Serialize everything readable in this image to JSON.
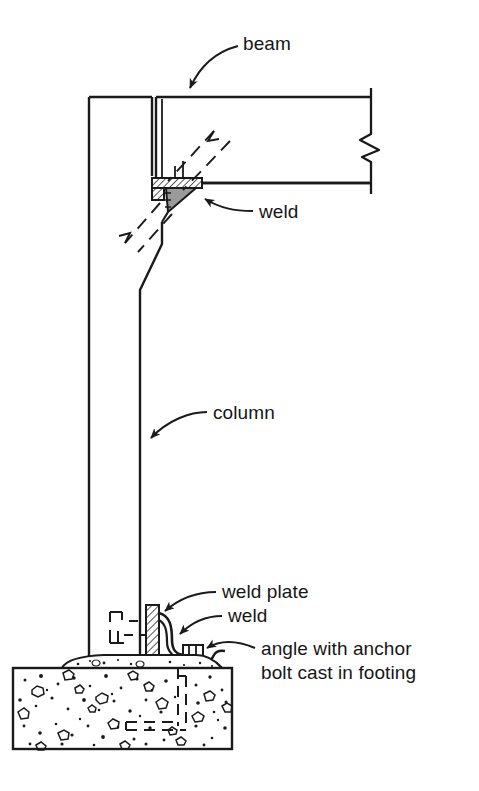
{
  "figure": {
    "name": "structural-connection-detail",
    "background_color": "#ffffff",
    "line_color": "#1a1a1a",
    "weld_fill_color": "#9a9a9a",
    "plate_hatch_color": "#1a1a1a"
  },
  "labels": {
    "beam": "beam",
    "weld_top": "weld",
    "column": "column",
    "weld_plate": "weld plate",
    "weld_bottom": "weld",
    "angle_line1": "angle with anchor",
    "angle_line2": "bolt cast in footing"
  },
  "parts": [
    {
      "id": "column",
      "label": "column",
      "description": "vertical steel column, tapered at upper transition"
    },
    {
      "id": "beam",
      "label": "beam",
      "description": "horizontal steel beam with break symbol at right"
    },
    {
      "id": "weld-top",
      "label": "weld",
      "description": "fillet weld at beam seat to column"
    },
    {
      "id": "seat-plate",
      "label": "seat plate",
      "description": "hatched bearing plate under beam"
    },
    {
      "id": "weld-plate",
      "label": "weld plate",
      "description": "hatched vertical plate at column base"
    },
    {
      "id": "weld-bottom",
      "label": "weld",
      "description": "fillet weld joining base plate to angle"
    },
    {
      "id": "angle-anchor",
      "label": "angle with anchor bolt cast in footing",
      "description": "steel angle with anchor bolt embedded in concrete footing"
    },
    {
      "id": "footing",
      "label": "footing",
      "description": "concrete footing shown with aggregate hatch"
    },
    {
      "id": "grout-bed",
      "label": "grout bed",
      "description": "bedding layer on top of footing"
    }
  ],
  "symbols": {
    "break_symbol": "zig-zag break line at right end of beam",
    "hidden_lines": "dashed lines indicate hidden/section-cut geometry",
    "concrete_hatch": "stippled dots and aggregate outlines denote concrete"
  }
}
